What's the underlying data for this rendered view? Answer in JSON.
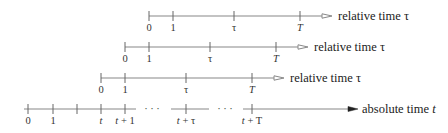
{
  "diagram": {
    "type": "timeline",
    "line_color": "#888888",
    "text_color": "#222222",
    "relative_axes": [
      {
        "y": 16,
        "x_start": 149,
        "x_line_end": 322,
        "arrow_x": 332,
        "label": "relative time τ",
        "label_x": 338,
        "ticks": [
          {
            "x": 149,
            "label": "0",
            "italic": false
          },
          {
            "x": 173,
            "label": "1",
            "italic": false
          },
          {
            "x": 234,
            "label": "τ",
            "italic": false
          },
          {
            "x": 300,
            "label": "T",
            "italic": true
          }
        ]
      },
      {
        "y": 47,
        "x_start": 125,
        "x_line_end": 298,
        "arrow_x": 308,
        "label": "relative time τ",
        "label_x": 314,
        "ticks": [
          {
            "x": 125,
            "label": "0",
            "italic": false
          },
          {
            "x": 149,
            "label": "1",
            "italic": false
          },
          {
            "x": 210,
            "label": "τ",
            "italic": false
          },
          {
            "x": 276,
            "label": "T",
            "italic": true
          }
        ]
      },
      {
        "y": 78,
        "x_start": 101,
        "x_line_end": 274,
        "arrow_x": 284,
        "label": "relative time τ",
        "label_x": 290,
        "ticks": [
          {
            "x": 101,
            "label": "0",
            "italic": false
          },
          {
            "x": 125,
            "label": "1",
            "italic": false
          },
          {
            "x": 186,
            "label": "τ",
            "italic": false
          },
          {
            "x": 252,
            "label": "T",
            "italic": true
          }
        ]
      }
    ],
    "absolute_axis": {
      "y": 109,
      "x_start": 24,
      "arrow_x": 358,
      "label": "absolute time t",
      "label_x": 362,
      "segments": [
        [
          24,
          136
        ],
        [
          171,
          209
        ],
        [
          243,
          350
        ]
      ],
      "ellipses": [
        {
          "x": 152,
          "text": "· · ·"
        },
        {
          "x": 225,
          "text": "· · ·"
        }
      ],
      "ticks": [
        {
          "x": 28,
          "label": "0"
        },
        {
          "x": 53,
          "label": "1"
        },
        {
          "x": 77,
          "label": ""
        },
        {
          "x": 101,
          "label": "t"
        },
        {
          "x": 125,
          "label": "t + 1"
        },
        {
          "x": 186,
          "label": "t + τ"
        },
        {
          "x": 252,
          "label": "t + T"
        }
      ]
    }
  }
}
